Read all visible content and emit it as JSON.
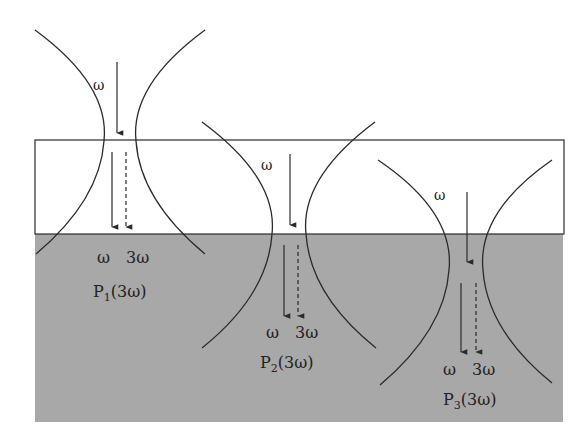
{
  "colors": {
    "background": "#ffffff",
    "substrate": "#a8a8a8",
    "film": "#ffffff",
    "line": "#2a2a2a"
  },
  "layers": {
    "film": {
      "x": 35,
      "y": 140,
      "width": 529,
      "height": 94
    },
    "substrate": {
      "x": 35,
      "y": 234,
      "width": 528,
      "height": 188
    }
  },
  "beams": [
    {
      "id": "P1",
      "incident_label": "ω",
      "fundamental_label": "ω",
      "harmonic_label": "3ω",
      "polarization_label": "P",
      "polarization_sub": "1",
      "polarization_arg": "(3ω)"
    },
    {
      "id": "P2",
      "incident_label": "ω",
      "fundamental_label": "ω",
      "harmonic_label": "3ω",
      "polarization_label": "P",
      "polarization_sub": "2",
      "polarization_arg": "(3ω)"
    },
    {
      "id": "P3",
      "incident_label": "ω",
      "fundamental_label": "ω",
      "harmonic_label": "3ω",
      "polarization_label": "P",
      "polarization_sub": "3",
      "polarization_arg": "(3ω)"
    }
  ]
}
